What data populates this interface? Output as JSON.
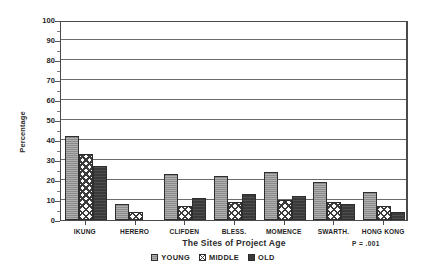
{
  "chart_data": {
    "type": "bar",
    "title": "",
    "xlabel": "The Sites of Project Age",
    "ylabel": "Percentage",
    "categories": [
      "IKUNG",
      "HERERO",
      "CLIFDEN",
      "BLESS.",
      "MOMENCE",
      "SWARTH.",
      "HONG KONG"
    ],
    "series": [
      {
        "name": "YOUNG",
        "values": [
          42,
          8,
          23,
          22,
          24,
          19,
          14
        ]
      },
      {
        "name": "MIDDLE",
        "values": [
          33,
          4,
          7,
          9,
          10,
          9,
          7
        ]
      },
      {
        "name": "OLD",
        "values": [
          27,
          0,
          11,
          13,
          12,
          8,
          4
        ]
      }
    ],
    "ylim": [
      0,
      100
    ],
    "yticks": [
      0,
      10,
      20,
      30,
      40,
      50,
      60,
      70,
      80,
      90,
      100
    ],
    "ytick_labels": [
      "0",
      "10",
      "20",
      "30",
      "40",
      "50",
      "60",
      "70",
      "80",
      "90",
      "100"
    ],
    "grid": true,
    "legend_position": "bottom",
    "annotations": [
      {
        "name": "p-value",
        "text": "P = .001"
      }
    ]
  },
  "legend": {
    "entries": [
      {
        "label": "YOUNG",
        "pattern": "gray-fill"
      },
      {
        "label": "MIDDLE",
        "pattern": "checkered-fill"
      },
      {
        "label": "OLD",
        "pattern": "black-fill"
      }
    ]
  }
}
